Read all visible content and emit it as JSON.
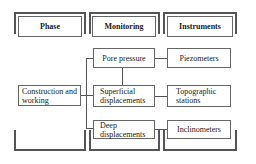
{
  "headers": [
    {
      "id": "phase",
      "label": "Phase"
    },
    {
      "id": "monitoring",
      "label": "Monitoring"
    },
    {
      "id": "instruments",
      "label": "Instruments"
    }
  ],
  "phase": {
    "label": "Construction and working"
  },
  "monitoring": [
    {
      "label": "Pore pressure"
    },
    {
      "label": "Superficial displacements"
    },
    {
      "label": "Deep displacements"
    }
  ],
  "instruments": [
    {
      "label": "Piezometers"
    },
    {
      "label": "Topographic stations"
    },
    {
      "label": "Inclinometers"
    }
  ],
  "colors": {
    "line": "#555555",
    "box_border": "#666666",
    "background": "#ffffff"
  }
}
